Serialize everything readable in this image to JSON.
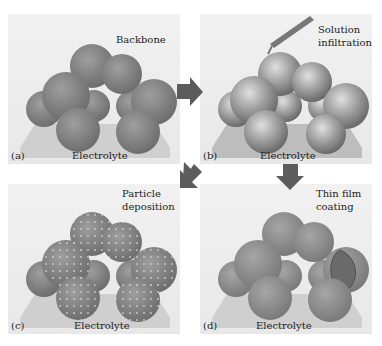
{
  "figure": {
    "panels": [
      {
        "id": "a",
        "tag": "(a)",
        "title": "Backbone",
        "substrate": "Electrolyte"
      },
      {
        "id": "b",
        "tag": "(b)",
        "title_line1": "Solution",
        "title_line2": "infiltration",
        "substrate": "Electrolyte"
      },
      {
        "id": "c",
        "tag": "(c)",
        "title_line1": "Particle",
        "title_line2": "deposition",
        "substrate": "Electrolyte"
      },
      {
        "id": "d",
        "tag": "(d)",
        "title_line1": "Thin film",
        "title_line2": "coating",
        "substrate": "Electrolyte"
      }
    ],
    "arrows": [
      {
        "from": "a",
        "to": "b",
        "direction": "right"
      },
      {
        "from": "b",
        "to": "c",
        "direction": "down-left"
      },
      {
        "from": "b",
        "to": "d",
        "direction": "down"
      }
    ],
    "colors": {
      "sphere": "#8a8a8a",
      "sphere_shiny": "#a8a8a8",
      "substrate": "#cfcfcf",
      "arrow": "#5c5c5c",
      "panel_bg": "#ececec"
    }
  }
}
